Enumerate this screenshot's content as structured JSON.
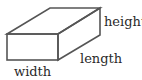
{
  "diagram": {
    "type": "rectangular-prism",
    "line_color": "#555555",
    "text_color": "#2a2a2a",
    "labels": {
      "height": "height",
      "length": "length",
      "width": "width"
    },
    "vertices": {
      "front_top_left": [
        7,
        34
      ],
      "front_top_right": [
        58,
        34
      ],
      "front_bottom_left": [
        7,
        60
      ],
      "front_bottom_right": [
        58,
        60
      ],
      "back_top_left": [
        50,
        8
      ],
      "back_top_right": [
        100,
        8
      ],
      "back_bottom_right": [
        100,
        35
      ]
    }
  }
}
